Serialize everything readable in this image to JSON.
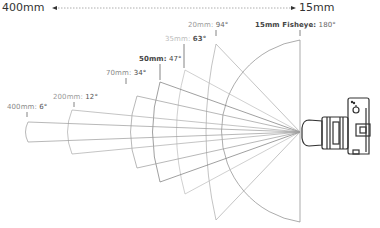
{
  "header": {
    "left_label": "400mm",
    "right_label": "15mm"
  },
  "lenses": [
    {
      "focal": "400mm:",
      "angle": "6°",
      "color": "#777777",
      "bold": false
    },
    {
      "focal": "200mm:",
      "angle": "12°",
      "color": "#888888",
      "bold": false
    },
    {
      "focal": "70mm:",
      "angle": "34°",
      "color": "#777777",
      "bold": false
    },
    {
      "focal": "50mm:",
      "angle": "47°",
      "color": "#444444",
      "bold": true
    },
    {
      "focal": "35mm:",
      "angle": "63°",
      "color": "#aaaaaa",
      "bold": false
    },
    {
      "focal": "20mm:",
      "angle": "94°",
      "color": "#888888",
      "bold": false
    },
    {
      "focal": "15mm Fisheye:",
      "angle": "180°",
      "color": "#444444",
      "bold": true
    }
  ],
  "icons": {
    "camera": "camera-with-zoom-lens-icon"
  }
}
